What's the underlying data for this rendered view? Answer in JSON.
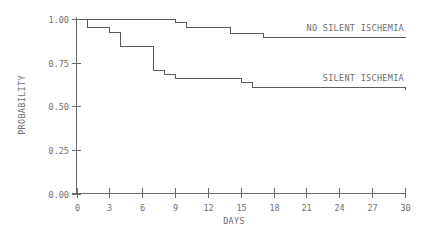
{
  "chart_data": {
    "type": "line",
    "subtype": "kaplan-meier step",
    "title": "",
    "xlabel": "DAYS",
    "ylabel": "PROBABILITY",
    "xlim": [
      0,
      30
    ],
    "ylim": [
      0.0,
      1.0
    ],
    "x_ticks": [
      0,
      3,
      6,
      9,
      12,
      15,
      18,
      21,
      24,
      27,
      30
    ],
    "x_tick_labels": [
      "0",
      "3",
      "6",
      "9",
      "12",
      "15",
      "18",
      "21",
      "24",
      "27",
      "30"
    ],
    "y_ticks": [
      0.0,
      0.25,
      0.5,
      0.75,
      1.0
    ],
    "y_tick_labels": [
      "0.00",
      "0.25",
      "0.50",
      "0.75",
      "1.00"
    ],
    "grid": false,
    "legend": "inline labels at right end of curves",
    "series": [
      {
        "name": "NO SILENT ISCHEMIA",
        "steps": [
          {
            "x": 0,
            "y": 1.0
          },
          {
            "x": 9,
            "y": 0.98
          },
          {
            "x": 10,
            "y": 0.955
          },
          {
            "x": 14,
            "y": 0.92
          },
          {
            "x": 17,
            "y": 0.895
          }
        ],
        "end_x": 30
      },
      {
        "name": "SILENT ISCHEMIA",
        "steps": [
          {
            "x": 0,
            "y": 1.0
          },
          {
            "x": 1,
            "y": 0.955
          },
          {
            "x": 3,
            "y": 0.925
          },
          {
            "x": 4,
            "y": 0.845
          },
          {
            "x": 7,
            "y": 0.71
          },
          {
            "x": 8,
            "y": 0.685
          },
          {
            "x": 9,
            "y": 0.66
          },
          {
            "x": 15,
            "y": 0.64
          },
          {
            "x": 16,
            "y": 0.61
          },
          {
            "x": 30,
            "y": 0.6
          }
        ],
        "end_x": 30
      }
    ]
  }
}
